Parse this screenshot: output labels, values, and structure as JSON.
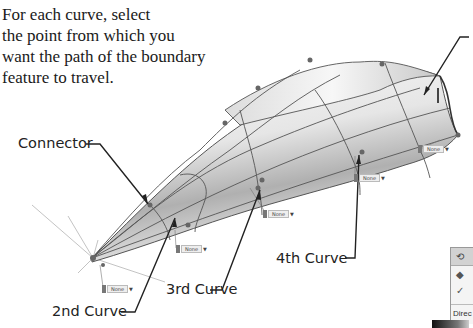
{
  "instruction": {
    "lines": [
      "For each curve, select",
      "the point from which you",
      "want the path of the boundary",
      "feature to travel."
    ]
  },
  "callouts": {
    "connector": "Connector",
    "second_curve": "2nd Curve",
    "third_curve": "3rd Curve",
    "fourth_curve": "4th Curve"
  },
  "dropdown_tags": [
    {
      "id": "tag-1",
      "label": "None"
    },
    {
      "id": "tag-2",
      "label": "None"
    },
    {
      "id": "tag-3",
      "label": "None"
    },
    {
      "id": "tag-4",
      "label": "None"
    },
    {
      "id": "tag-5",
      "label": "None"
    }
  ],
  "panel": {
    "header_icon": "boundary-feature-icon",
    "row1_icon": "surface-icon",
    "row2_icon": "checkmark-icon",
    "section_label": "Direc"
  },
  "colors": {
    "surface_light": "#f2f2f2",
    "surface_dark": "#9a9a9a",
    "curve_line": "#555555",
    "point": "#666666"
  }
}
